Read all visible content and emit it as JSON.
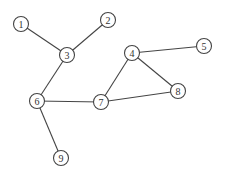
{
  "graph": {
    "node_radius": 7.5,
    "stroke_color": "#444444",
    "nodes": [
      {
        "id": "1",
        "label": "1",
        "x": 21,
        "y": 24
      },
      {
        "id": "2",
        "label": "2",
        "x": 108,
        "y": 20
      },
      {
        "id": "3",
        "label": "3",
        "x": 67,
        "y": 55
      },
      {
        "id": "4",
        "label": "4",
        "x": 132,
        "y": 53
      },
      {
        "id": "5",
        "label": "5",
        "x": 204,
        "y": 46
      },
      {
        "id": "6",
        "label": "6",
        "x": 37,
        "y": 101
      },
      {
        "id": "7",
        "label": "7",
        "x": 101,
        "y": 102
      },
      {
        "id": "8",
        "label": "8",
        "x": 178,
        "y": 91
      },
      {
        "id": "9",
        "label": "9",
        "x": 61,
        "y": 158
      }
    ],
    "edges": [
      {
        "from": "1",
        "to": "3"
      },
      {
        "from": "2",
        "to": "3"
      },
      {
        "from": "3",
        "to": "6"
      },
      {
        "from": "6",
        "to": "7"
      },
      {
        "from": "6",
        "to": "9"
      },
      {
        "from": "7",
        "to": "4"
      },
      {
        "from": "7",
        "to": "8"
      },
      {
        "from": "4",
        "to": "5"
      },
      {
        "from": "4",
        "to": "8"
      }
    ]
  }
}
